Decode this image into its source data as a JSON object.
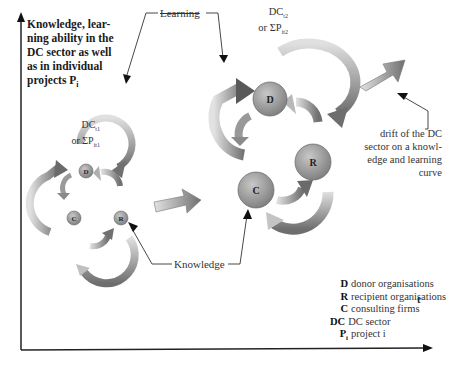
{
  "diagram": {
    "y_axis_label": "Knowledge, lear-ning ability in the DC sector as well as in individual projects P",
    "y_axis_label_lines": [
      "Knowledge, lear-",
      "ning ability in the",
      "DC sector as well",
      "as in individual",
      "projects P"
    ],
    "y_axis_label_sub": "i",
    "x_axis_label": "t",
    "learning_label": "Learning",
    "knowledge_label": "Knowledge",
    "cluster_t1": {
      "label_line1": "DC",
      "label_line1_sub": "t1",
      "label_line2": "or ΣP",
      "label_line2_sub": "it1",
      "nodes": [
        "D",
        "C",
        "R"
      ]
    },
    "cluster_t2": {
      "label_line1": "DC",
      "label_line1_sub": "t2",
      "label_line2": "or ΣP",
      "label_line2_sub": "it2",
      "nodes": [
        "D",
        "C",
        "R"
      ]
    },
    "drift_annotation": [
      "drift of the DC",
      "sector on a knowl-",
      "edge and learning",
      "curve"
    ],
    "legend": [
      {
        "key": "D",
        "text": "donor organisations"
      },
      {
        "key": "R",
        "text": "recipient organisations"
      },
      {
        "key": "C",
        "text": "consulting firms"
      },
      {
        "key": "DC",
        "text": "DC sector"
      },
      {
        "key": "P",
        "key_sub": "i",
        "text": "project i"
      }
    ],
    "colors": {
      "arrow_fill": "#8c8c8c",
      "arrow_light": "#d6d6d6",
      "node_fill": "#a8a8a8",
      "axis": "#222222"
    }
  }
}
